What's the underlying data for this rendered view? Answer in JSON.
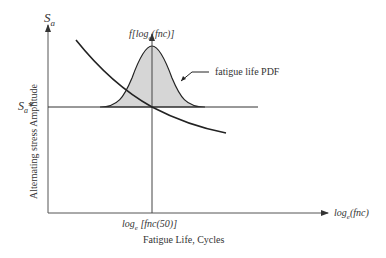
{
  "diagram": {
    "title": "",
    "y_axis": {
      "symbol": "S",
      "symbol_sub": "a",
      "label": "Alternating stress Amplitude"
    },
    "x_axis": {
      "symbol": "log",
      "symbol_sub": "e",
      "symbol_tail": "(fnc)",
      "label": "Fatigue Life, Cycles"
    },
    "pdf_axis": {
      "prefix": "f[log",
      "sub": "e",
      "tail": "(fnc)]"
    },
    "threshold": {
      "symbol": "S",
      "sub": "a",
      "tail": "*"
    },
    "median_tick": {
      "prefix": "log",
      "sub": "e",
      "tail": " [fnc(50)]"
    },
    "annotation": "fatigue life PDF",
    "colors": {
      "line": "#222222",
      "fill": "#d6d6d6",
      "axis": "#555555"
    }
  }
}
